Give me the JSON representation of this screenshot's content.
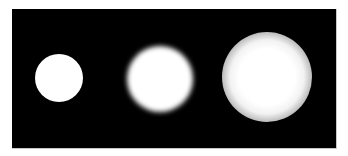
{
  "figure": {
    "background_color": "#000000",
    "page_color": "#ffffff",
    "spots": [
      {
        "label": "sharp",
        "cx": 59,
        "cy": 78,
        "radius": 24,
        "core_radius": 24,
        "blur": 0.5,
        "color": "#ffffff"
      },
      {
        "label": "slight-blur",
        "cx": 160,
        "cy": 79,
        "radius": 33,
        "core_radius": 28,
        "blur": 2.5,
        "color": "#ffffff"
      },
      {
        "label": "heavy-blur",
        "cx": 267,
        "cy": 77,
        "radius": 45,
        "core_radius": 20,
        "blur": 0,
        "color": "#ffffff"
      }
    ]
  }
}
